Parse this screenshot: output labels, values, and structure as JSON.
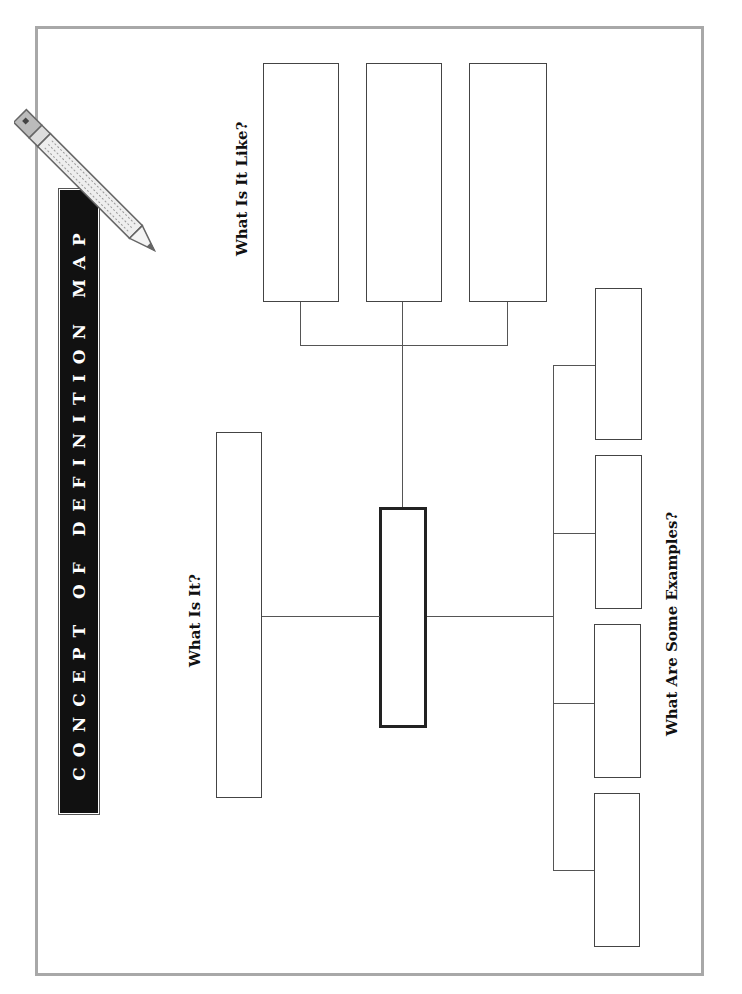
{
  "title": "CONCEPT OF DEFINITION MAP",
  "labels": {
    "what_is_it": "What Is It?",
    "what_is_it_like": "What Is It Like?",
    "examples": "What Are Some Examples?"
  },
  "colors": {
    "frame": "#a8a8a8",
    "title_bg": "#111111",
    "title_text": "#ffffff",
    "lines": "#555555"
  },
  "icons": {
    "decoration": "pencil-icon"
  }
}
